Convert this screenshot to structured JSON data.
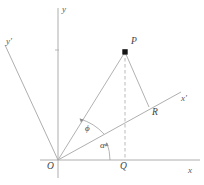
{
  "figure": {
    "type": "geometry-diagram",
    "background_color": "#ffffff",
    "line_color": "#9a9a9a",
    "point_color": "#1a1a1a",
    "label_color": "#4a4a4a",
    "axes": [
      {
        "id": "x",
        "label": "x",
        "label_x": 188,
        "label_y": 168
      },
      {
        "id": "y",
        "label": "y",
        "label_x": 62,
        "label_y": 6
      },
      {
        "id": "x-prime",
        "label": "x'",
        "label_x": 182,
        "label_y": 96
      },
      {
        "id": "y-prime",
        "label": "y'",
        "label_x": 6,
        "label_y": 38
      }
    ],
    "points": [
      {
        "id": "O",
        "label": "O",
        "label_x": 48,
        "label_y": 164,
        "marked": false
      },
      {
        "id": "P",
        "label": "P",
        "label_x": 130,
        "label_y": 38,
        "marked": true
      },
      {
        "id": "Q",
        "label": "Q",
        "label_x": 120,
        "label_y": 164,
        "marked": false
      },
      {
        "id": "R",
        "label": "R",
        "label_x": 152,
        "label_y": 110,
        "marked": false
      }
    ],
    "angles": [
      {
        "id": "phi",
        "label": "ϕ",
        "label_x": 85,
        "label_y": 125
      },
      {
        "id": "alpha",
        "label": "α",
        "label_x": 100,
        "label_y": 142
      }
    ],
    "geometry": {
      "origin": {
        "x": 58,
        "y": 160
      },
      "point_p": {
        "x": 125,
        "y": 52
      },
      "point_q": {
        "x": 125,
        "y": 160
      },
      "point_r": {
        "x": 149,
        "y": 107
      },
      "x_axis_end": {
        "x": 200,
        "y": 160
      },
      "y_axis_top": {
        "x": 58,
        "y": 8
      },
      "x_prime_end": {
        "x": 181,
        "y": 92
      },
      "y_prime_end": {
        "x": 5,
        "y": 45
      }
    }
  }
}
